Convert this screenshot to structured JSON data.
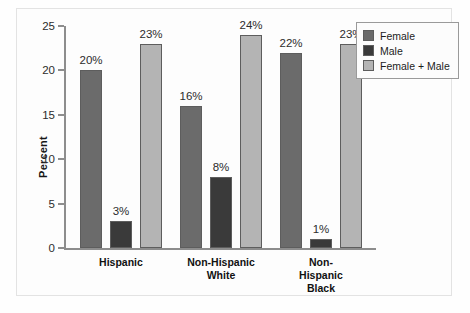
{
  "chart_data": {
    "type": "bar",
    "title": "",
    "xlabel": "",
    "ylabel": "Percent",
    "ylim": [
      0,
      25
    ],
    "yticks": [
      0,
      5,
      10,
      15,
      20,
      25
    ],
    "ytick_labels": [
      "0",
      "5",
      "10",
      "15",
      "20",
      "25"
    ],
    "grid": false,
    "legend_position": "top-right",
    "categories": [
      "Hispanic",
      "Non-Hispanic White",
      "Non-Hispanic Black"
    ],
    "category_labels": [
      "Hispanic",
      "Non-Hispanic\nWhite",
      "Non-Hispanic\nBlack"
    ],
    "series": [
      {
        "name": "Female",
        "color": "#6b6b6b",
        "values": [
          20,
          16,
          22
        ],
        "value_labels": [
          "20%",
          "16%",
          "22%"
        ]
      },
      {
        "name": "Male",
        "color": "#3a3a3a",
        "values": [
          3,
          8,
          1
        ],
        "value_labels": [
          "3%",
          "8%",
          "1%"
        ]
      },
      {
        "name": "Female + Male",
        "color": "#b4b4b4",
        "values": [
          23,
          24,
          23
        ],
        "value_labels": [
          "23%",
          "24%",
          "23%"
        ]
      }
    ]
  },
  "legend": {
    "items": [
      {
        "label": "Female",
        "color": "#6b6b6b"
      },
      {
        "label": "Male",
        "color": "#3a3a3a"
      },
      {
        "label": "Female + Male",
        "color": "#b4b4b4"
      }
    ]
  },
  "axis": {
    "y_title": "Percent",
    "y_tick_labels": [
      "25",
      "20",
      "15",
      "10",
      "5",
      "0"
    ]
  },
  "colors": {
    "female": "#6b6b6b",
    "male": "#3a3a3a",
    "female_male": "#b4b4b4",
    "axis": "#8d8d8d",
    "frame": "#e3e3e3",
    "background": "#fdfdfd",
    "text": "#1c1c1c"
  }
}
